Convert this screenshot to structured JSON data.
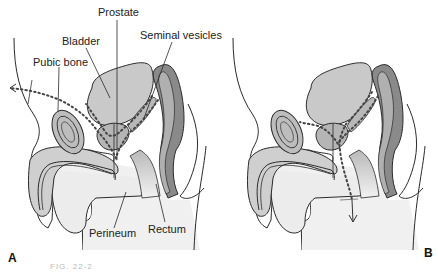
{
  "figure": {
    "caption_fragment": "FIG. 22-2",
    "panels": [
      {
        "id": "A",
        "letter": "A",
        "labels": {
          "prostate": "Prostate",
          "bladder": "Bladder",
          "seminal_vesicles": "Seminal vesicles",
          "pubic_bone": "Pubic bone",
          "perineum": "Perineum",
          "rectum": "Rectum"
        },
        "pathway_arrow": "dotted path exiting anteriorly (upper-left, suprapubic)"
      },
      {
        "id": "B",
        "letter": "B",
        "pathway_arrow": "dotted path exiting inferiorly through perineum"
      }
    ],
    "colors": {
      "outline": "#2a2a2a",
      "bladder_fill": "#c9c9c9",
      "rectum_outer": "#8a8a8a",
      "rectum_inner": "#b0b0b0",
      "penis_fill": "#cfcfcf",
      "urethra_fill": "#e4e4e4",
      "body_fill": "#eeeeee",
      "bone_fill": "#bdbdbd",
      "dots": "#444444"
    }
  }
}
